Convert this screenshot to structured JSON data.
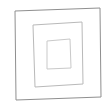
{
  "figure": {
    "background_color": "#ffffff",
    "width": 107,
    "height": 110,
    "shape_count": 3,
    "shapes": [
      {
        "name": "outer-square",
        "label": "Outer square",
        "stroke_color": "#8f8f8f",
        "stroke_width": 1,
        "fill": "none",
        "points": "15,11 100,8 101,97 16,100"
      },
      {
        "name": "middle-square",
        "label": "Middle square",
        "stroke_color": "#b9b9b9",
        "stroke_width": 1,
        "fill": "none",
        "points": "33,25 82,22 83,84 35,87"
      },
      {
        "name": "inner-square",
        "label": "Inner square",
        "stroke_color": "#c9c9c9",
        "stroke_width": 1,
        "fill": "none",
        "points": "47,41 70,39 71,68 47,69"
      }
    ]
  }
}
